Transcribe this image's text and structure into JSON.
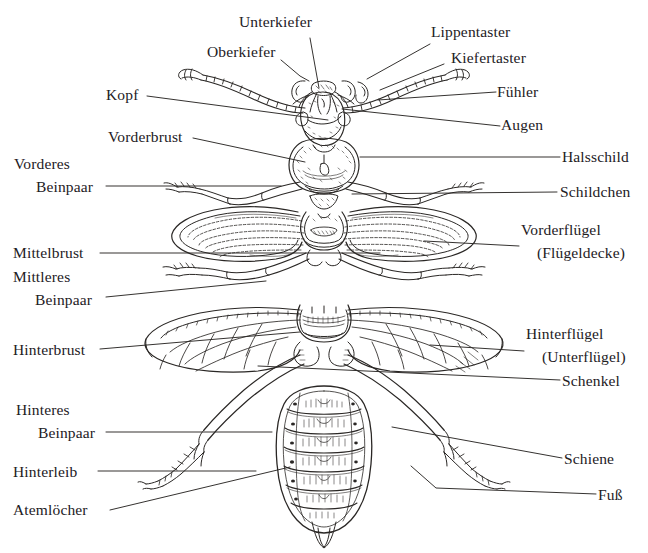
{
  "figure": {
    "kind": "labeled-anatomy-diagram",
    "language": "de",
    "background_color": "#ffffff",
    "ink_color": "#262321",
    "text_color": "#23201e"
  },
  "labels": {
    "unterkiefer": "Unterkiefer",
    "oberkiefer": "Oberkiefer",
    "lippentaster": "Lippentaster",
    "kiefertaster": "Kiefertaster",
    "kopf": "Kopf",
    "fuehler": "Fühler",
    "augen": "Augen",
    "vorderbrust": "Vorderbrust",
    "halsschild": "Halsschild",
    "vorderes": "Vorderes",
    "beinpaar1": "Beinpaar",
    "schildchen": "Schildchen",
    "vorderfluegel": "Vorderflügel",
    "fluegeldecke": "(Flügeldecke)",
    "mittelbrust": "Mittelbrust",
    "mittleres": "Mittleres",
    "beinpaar2": "Beinpaar",
    "hinterfluegel": "Hinterflügel",
    "unterfluegel": "(Unterflügel)",
    "hinterbrust": "Hinterbrust",
    "schenkel": "Schenkel",
    "hinteres": "Hinteres",
    "beinpaar3": "Beinpaar",
    "schiene": "Schiene",
    "hinterleib": "Hinterleib",
    "fuss": "Fuß",
    "atemloecher": "Atemlöcher"
  }
}
